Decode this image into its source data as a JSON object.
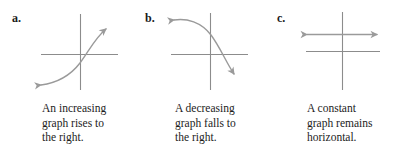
{
  "page": {
    "background_color": "#ffffff",
    "width": 398,
    "height": 152
  },
  "style": {
    "axis_color": "#8c8c8c",
    "curve_color": "#9a9a9a",
    "text_color": "#1c1c1c",
    "label_color": "#1a1a1a"
  },
  "panels": [
    {
      "label": "a.",
      "graph_kind": "increasing-curve",
      "caption_lines": [
        "An increasing",
        "graph rises to",
        "the right."
      ],
      "caption_text": "An increasing graph rises to the right."
    },
    {
      "label": "b.",
      "graph_kind": "decreasing-curve",
      "caption_lines": [
        "A decreasing",
        "graph falls to",
        "the right."
      ],
      "caption_text": "A decreasing graph falls to the right."
    },
    {
      "label": "c.",
      "graph_kind": "constant-horizontal-line",
      "caption_lines": [
        "A constant",
        "graph remains",
        "horizontal."
      ],
      "caption_text": "A constant graph remains horizontal."
    }
  ]
}
